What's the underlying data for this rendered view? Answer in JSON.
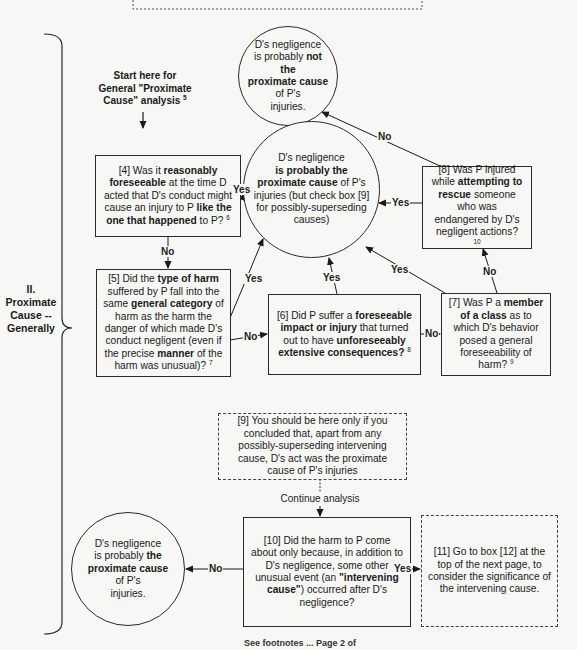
{
  "section": {
    "label_line1": "II.",
    "label_line2": "Proximate",
    "label_line3": "Cause --",
    "label_line4": "Generally"
  },
  "start": {
    "line1": "Start here for",
    "line2": "General \"Proximate",
    "line3": "Cause\" analysis",
    "footnote": "5"
  },
  "circles": {
    "not_proximate": {
      "l1": "D's negligence",
      "l2a": "is probably ",
      "l2b": "not the",
      "l3": "proximate cause",
      "l4": "of P's",
      "l5": "injuries."
    },
    "proximate_main": {
      "l1": "D's negligence",
      "l2": "is probably the",
      "l3a": "proximate cause",
      "l3b": " of P's",
      "l4": "injuries (but check box [9]",
      "l5": "for possibly-superseding",
      "l6": "causes)"
    },
    "proximate_final": {
      "l1": "D's negligence",
      "l2a": "is probably ",
      "l2b": "the",
      "l3": "proximate cause",
      "l4": "of P's",
      "l5": "injuries."
    }
  },
  "boxes": {
    "b4": {
      "t1": "[4] Was it ",
      "t2": "reasonably foreseeable",
      "t3": " at the time D acted that D's conduct might cause an injury to P ",
      "t4": "like the one that happened",
      "t5": " to P?",
      "fn": "6"
    },
    "b5": {
      "t1": "[5] Did the ",
      "t2": "type of harm",
      "t3": " suffered by P fall into the same ",
      "t4": "general category",
      "t5": " of harm as the harm the danger of which made D's conduct negligent (even if the precise ",
      "t6": "manner",
      "t7": " of the harm was unusual)?",
      "fn": "7"
    },
    "b6": {
      "t1": "[6] Did P suffer a ",
      "t2": "foreseeable impact or injury",
      "t3": " that turned out to have ",
      "t4": "unforeseeably extensive consequences?",
      "fn": "8"
    },
    "b7": {
      "t1": "[7] Was P a ",
      "t2": "member of a class",
      "t3": " as to which D's behavior posed a general foreseeability of harm?",
      "fn": "9"
    },
    "b8": {
      "t1": "[8] Was P injured while ",
      "t2": "attempting to rescue",
      "t3": " someone who was endangered by D's negligent actions?",
      "fn": "10"
    },
    "b9": {
      "text": "[9] You should be here only if you concluded that, apart from any possibly-superseding intervening cause, D's act was the proximate cause of P's injuries"
    },
    "b10": {
      "t1": "[10] Did the harm to P come about only because, in addition to D's negligence, some other unusual event (an ",
      "t2": "\"intervening cause\"",
      "t3": ") occurred after D's negligence?"
    },
    "b11": {
      "text": "[11] Go to box [12] at the top of the next page, to consider the significance of the intervening cause."
    }
  },
  "edge_labels": {
    "yes": "Yes",
    "no": "No",
    "continue": "Continue analysis"
  },
  "footer": {
    "text": "See footnotes ... Page 2 of"
  }
}
